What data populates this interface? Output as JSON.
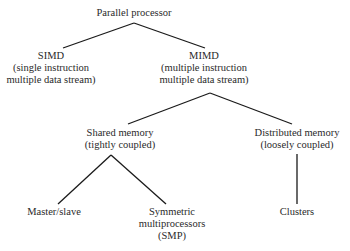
{
  "diagram": {
    "colors": {
      "text": "#2a2a2a",
      "line": "#1a1a1a",
      "background": "#ffffff"
    },
    "nodes": {
      "root": {
        "lines": [
          "Parallel processor"
        ],
        "x": 134,
        "y": 7
      },
      "simd": {
        "lines": [
          "SIMD",
          "(single instruction",
          "multiple data stream)"
        ],
        "x": 51,
        "y": 50
      },
      "mimd": {
        "lines": [
          "MIMD",
          "(multiple instruction",
          "multiple data stream)"
        ],
        "x": 204,
        "y": 50
      },
      "shared": {
        "lines": [
          "Shared memory",
          "(tightly coupled)"
        ],
        "x": 120,
        "y": 127
      },
      "distributed": {
        "lines": [
          "Distributed memory",
          "(loosely coupled)"
        ],
        "x": 297,
        "y": 127
      },
      "masterslave": {
        "lines": [
          "Master/slave"
        ],
        "x": 54,
        "y": 206
      },
      "smp": {
        "lines": [
          "Symmetric",
          "multiprocessors",
          "(SMP)"
        ],
        "x": 172,
        "y": 206
      },
      "clusters": {
        "lines": [
          "Clusters"
        ],
        "x": 297,
        "y": 206
      }
    },
    "edges": [
      {
        "from": "root",
        "to": "simd",
        "x1": 134,
        "y1": 23,
        "x2": 63,
        "y2": 48
      },
      {
        "from": "root",
        "to": "mimd",
        "x1": 134,
        "y1": 23,
        "x2": 205,
        "y2": 48
      },
      {
        "from": "mimd",
        "to": "shared",
        "x1": 210,
        "y1": 93,
        "x2": 128,
        "y2": 124
      },
      {
        "from": "mimd",
        "to": "distributed",
        "x1": 210,
        "y1": 93,
        "x2": 292,
        "y2": 124
      },
      {
        "from": "shared",
        "to": "masterslave",
        "x1": 111,
        "y1": 155,
        "x2": 58,
        "y2": 204
      },
      {
        "from": "shared",
        "to": "smp",
        "x1": 111,
        "y1": 155,
        "x2": 166,
        "y2": 204
      },
      {
        "from": "distributed",
        "to": "clusters",
        "x1": 297,
        "y1": 154,
        "x2": 297,
        "y2": 204
      }
    ]
  }
}
